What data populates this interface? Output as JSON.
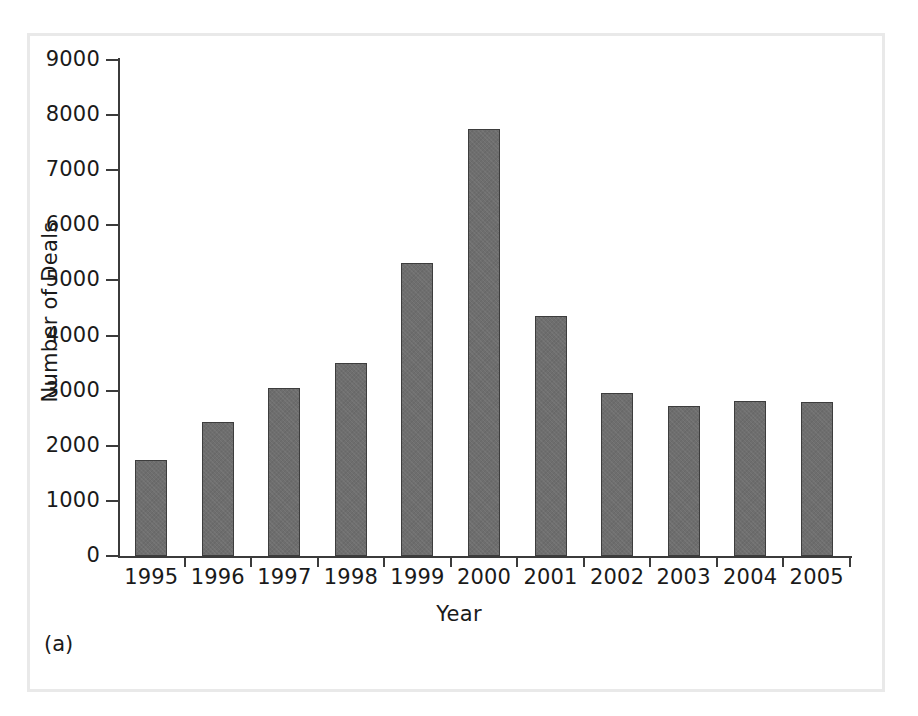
{
  "figure": {
    "panel_label": "(a)",
    "frame_color": "#e9e9e9",
    "background_color": "#ffffff"
  },
  "chart_data": {
    "type": "bar",
    "title": "",
    "subtitle": "",
    "xlabel": "Year",
    "ylabel": "Number of Deals",
    "categories": [
      "1995",
      "1996",
      "1997",
      "1998",
      "1999",
      "2000",
      "2001",
      "2002",
      "2003",
      "2004",
      "2005"
    ],
    "values": [
      1750,
      2440,
      3040,
      3500,
      5320,
      7740,
      4360,
      2950,
      2730,
      2810,
      2790
    ],
    "ylim": [
      0,
      9000
    ],
    "ytick_labels": [
      "9000",
      "8000",
      "7000",
      "6000",
      "5000",
      "4000",
      "3000",
      "2000",
      "1000",
      "0"
    ],
    "yticks": [
      9000,
      8000,
      7000,
      6000,
      5000,
      4000,
      3000,
      2000,
      1000,
      0
    ],
    "grid": false,
    "legend": null,
    "legend_position": "none",
    "bar_color": "#6e6e6e",
    "bar_edge_color": "#3d3d3d",
    "axis_color": "#3b3b3b",
    "annotations": []
  }
}
